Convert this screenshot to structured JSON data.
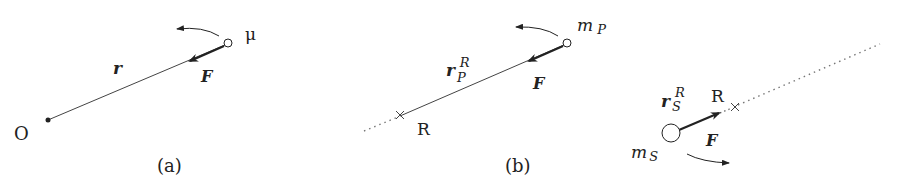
{
  "panels": {
    "a": {
      "caption": "(a)",
      "origin_label": "O",
      "mass_label": "μ",
      "vector_label": "r",
      "force_label": "F"
    },
    "b": {
      "caption": "(b)",
      "ref_label": "R",
      "mass_label": "m",
      "mass_sub": "P",
      "vector_label": "r",
      "vector_sub": "P",
      "vector_sup": "R",
      "force_label": "F"
    },
    "c": {
      "ref_label": "R",
      "mass_label": "m",
      "mass_sub": "S",
      "vector_label": "r",
      "vector_sub": "S",
      "vector_sup": "R",
      "force_label": "F"
    }
  },
  "colors": {
    "stroke": "#222222",
    "dotted": "#777777",
    "background": "#ffffff"
  }
}
